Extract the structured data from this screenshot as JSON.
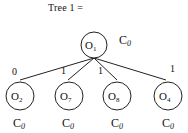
{
  "title": "Tree 1 =",
  "root": {
    "label": "O",
    "sub": "1",
    "cost": "C",
    "cost_sub": "0"
  },
  "children": [
    {
      "label": "O",
      "sub": "2",
      "edge": "0",
      "cost": "C",
      "cost_sub": "0"
    },
    {
      "label": "O",
      "sub": "7",
      "edge": "1",
      "cost": "C",
      "cost_sub": "0"
    },
    {
      "label": "O",
      "sub": "8",
      "edge": "1",
      "cost": "C",
      "cost_sub": "0"
    },
    {
      "label": "O",
      "sub": "4",
      "edge": "1",
      "cost": "C",
      "cost_sub": "0"
    }
  ]
}
